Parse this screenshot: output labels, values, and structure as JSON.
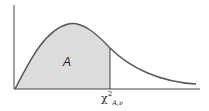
{
  "diagram": {
    "type": "chi-square distribution density curve with shaded left-tail area",
    "shaded_region_label": "A",
    "critical_value_label": {
      "symbol": "χ",
      "superscript": "2",
      "subscript": "A,ν"
    },
    "colors": {
      "curve": "#555555",
      "fill": "#dcdcdc",
      "axes": "#444444"
    }
  }
}
